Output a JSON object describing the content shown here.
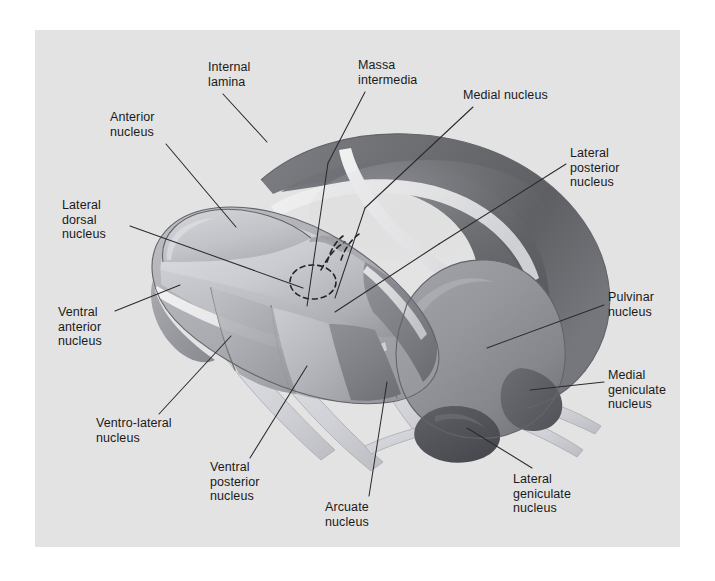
{
  "figure": {
    "kind": "anatomical-illustration",
    "panel_background": "#e3e3e3",
    "label_color": "#1a1a1a",
    "leader_line_color": "#2b2b2b"
  },
  "labels": [
    {
      "id": "internal-lamina",
      "lines": [
        "Internal",
        "lamina"
      ],
      "x": 173,
      "y": 30,
      "leader": [
        [
          188,
          64
        ],
        [
          232,
          112
        ]
      ]
    },
    {
      "id": "massa-intermedia",
      "lines": [
        "Massa",
        "intermedia"
      ],
      "x": 323,
      "y": 28,
      "leader": [
        [
          330,
          62
        ],
        [
          295,
          132
        ]
      ]
    },
    {
      "id": "medial-nucleus",
      "lines": [
        "Medial nucleus"
      ],
      "x": 428,
      "y": 58,
      "leader": [
        [
          438,
          77
        ],
        [
          373,
          138
        ]
      ]
    },
    {
      "id": "anterior-nucleus",
      "lines": [
        "Anterior",
        "nucleus"
      ],
      "x": 75,
      "y": 80,
      "leader": [
        [
          131,
          114
        ],
        [
          201,
          195
        ]
      ]
    },
    {
      "id": "lateral-posterior",
      "lines": [
        "Lateral",
        "posterior",
        "nucleus"
      ],
      "x": 535,
      "y": 116,
      "leader": [
        [
          531,
          134
        ],
        [
          441,
          184
        ]
      ]
    },
    {
      "id": "lateral-dorsal",
      "lines": [
        "Lateral",
        "dorsal",
        "nucleus"
      ],
      "x": 27,
      "y": 168,
      "leader": [
        [
          95,
          196
        ],
        [
          235,
          243
        ]
      ]
    },
    {
      "id": "ventral-anterior",
      "lines": [
        "Ventral",
        "anterior",
        "nucleus"
      ],
      "x": 23,
      "y": 275,
      "leader": [
        [
          80,
          280
        ],
        [
          140,
          258
        ]
      ]
    },
    {
      "id": "pulvinar-nucleus",
      "lines": [
        "Pulvinar",
        "nucleus"
      ],
      "x": 573,
      "y": 260,
      "leader": [
        [
          569,
          275
        ],
        [
          475,
          313
        ]
      ]
    },
    {
      "id": "medial-geniculate",
      "lines": [
        "Medial",
        "geniculate",
        "nucleus"
      ],
      "x": 573,
      "y": 338,
      "leader": [
        [
          569,
          352
        ],
        [
          507,
          372
        ]
      ]
    },
    {
      "id": "ventro-lateral",
      "lines": [
        "Ventro-lateral",
        "nucleus"
      ],
      "x": 61,
      "y": 386,
      "leader": [
        [
          124,
          384
        ],
        [
          192,
          318
        ]
      ]
    },
    {
      "id": "ventral-posterior",
      "lines": [
        "Ventral",
        "posterior",
        "nucleus"
      ],
      "x": 175,
      "y": 430,
      "leader": [
        [
          215,
          428
        ],
        [
          272,
          340
        ]
      ]
    },
    {
      "id": "arcuate-nucleus",
      "lines": [
        "Arcuate",
        "nucleus"
      ],
      "x": 290,
      "y": 470,
      "leader": [
        [
          334,
          466
        ],
        [
          363,
          363
        ]
      ]
    },
    {
      "id": "lateral-geniculate",
      "lines": [
        "Lateral",
        "geniculate",
        "nucleus"
      ],
      "x": 478,
      "y": 442,
      "leader": [
        [
          497,
          438
        ],
        [
          452,
          392
        ]
      ]
    }
  ],
  "palette": {
    "bg": "#e3e3e3",
    "dark_arc": "#6f7073",
    "dark_arc_shadow": "#55565a",
    "mid_gray": "#93949a",
    "light_gray": "#b3b4ba",
    "pale_gray": "#c3c4ca",
    "lightest": "#d2d3d8",
    "white_lamina": "#ececed",
    "pulvinar": "#8b8c92",
    "geniculate_dark": "#5a5b60",
    "tract_pale": "#d8d9dd",
    "outline": "#5f6064"
  }
}
